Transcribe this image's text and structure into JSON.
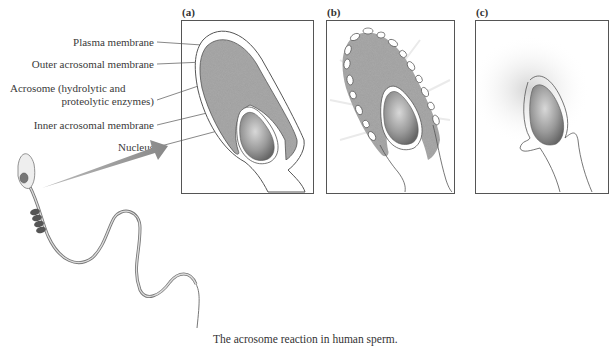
{
  "labels": {
    "plasma": "Plasma membrane",
    "outer": "Outer acrosomal membrane",
    "acrosome_1": "Acrosome (hydrolytic and",
    "acrosome_2": "proteolytic enzymes)",
    "inner": "Inner acrosomal membrane",
    "nucleus": "Nucleus"
  },
  "panels": [
    {
      "label": "(a)"
    },
    {
      "label": "(b)"
    },
    {
      "label": "(c)"
    }
  ],
  "caption": "The acrosome reaction in human sperm.",
  "colors": {
    "acrosome_fill": "#a9a9a9",
    "nucleus_fill": "#8a8a8a",
    "outline": "#555555",
    "arrow": "#8c8c8c"
  }
}
